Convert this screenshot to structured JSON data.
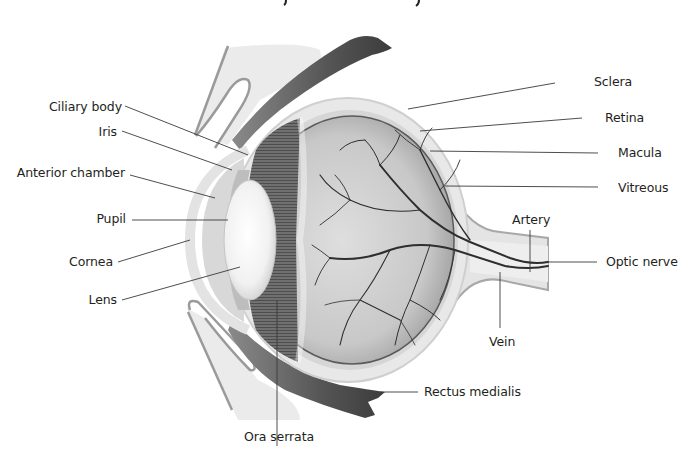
{
  "diagram": {
    "colors": {
      "background": "#ffffff",
      "label_text": "#231f20",
      "leader_line": "#3a3a3a",
      "sclera": "#e6e6e6",
      "retina_interior": "#c9c9c9",
      "ciliary_band": "#6e6e6e",
      "vessels": "#2b2b2b",
      "muscle": "#5a5a5a",
      "bone": "#ececec"
    },
    "labels_left": [
      {
        "id": "ciliary-body",
        "text": "Ciliary body"
      },
      {
        "id": "iris",
        "text": "Iris"
      },
      {
        "id": "anterior-chamber",
        "text": "Anterior chamber"
      },
      {
        "id": "pupil",
        "text": "Pupil"
      },
      {
        "id": "cornea",
        "text": "Cornea"
      },
      {
        "id": "lens",
        "text": "Lens"
      }
    ],
    "labels_right": [
      {
        "id": "sclera",
        "text": "Sclera"
      },
      {
        "id": "retina",
        "text": "Retina"
      },
      {
        "id": "macula",
        "text": "Macula"
      },
      {
        "id": "vitreous",
        "text": "Vitreous"
      },
      {
        "id": "artery",
        "text": "Artery"
      },
      {
        "id": "optic-nerve",
        "text": "Optic nerve"
      },
      {
        "id": "vein",
        "text": "Vein"
      }
    ],
    "labels_bottom": [
      {
        "id": "rectus-medialis",
        "text": "Rectus medialis"
      },
      {
        "id": "ora-serrata",
        "text": "Ora serrata"
      }
    ]
  }
}
